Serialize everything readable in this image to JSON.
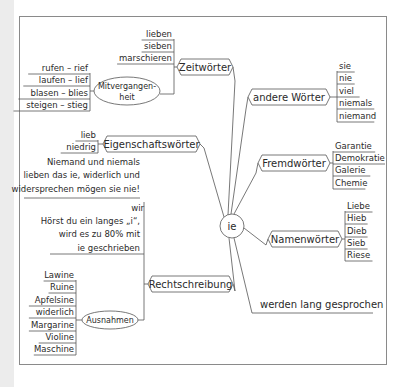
{
  "diagram": {
    "type": "mindmap",
    "center": {
      "label": "ie",
      "x": 232,
      "y": 226,
      "r": 12
    },
    "branches": [
      {
        "id": "zeitwoerter",
        "label": "Zeitwörter",
        "shape": "hex",
        "box": [
          177,
          59,
          56,
          16
        ],
        "leaves_side": "left",
        "leaves": [
          "lieben",
          "sieben",
          "marschieren"
        ],
        "leaves_x": [
          118,
          174
        ],
        "leaves_y": [
          37,
          49,
          61
        ],
        "sub": {
          "label_lines": [
            "Mitvergangen-",
            "heit"
          ],
          "shape": "ellipse",
          "cx": 127,
          "cy": 91,
          "rx": 33,
          "ry": 14,
          "leaves": [
            "rufen – rief",
            "laufen – lief",
            "blasen – blies",
            "steigen – stieg"
          ],
          "leaves_x": [
            30,
            90
          ],
          "leaves_y": [
            71,
            83,
            96,
            108
          ]
        }
      },
      {
        "id": "andere_woerter",
        "label": "andere Wörter",
        "shape": "hex",
        "box": [
          248,
          89,
          82,
          16
        ],
        "leaves_side": "right",
        "leaves": [
          "sie",
          "nie",
          "viel",
          "niemals",
          "niemand"
        ],
        "leaves_x": [
          337,
          380
        ],
        "leaves_y": [
          69,
          81,
          94,
          106,
          119
        ]
      },
      {
        "id": "eigenschaftswoerter",
        "label": "Eigenschaftswörter",
        "shape": "hex",
        "box": [
          103,
          136,
          97,
          16
        ],
        "leaves_side": "left",
        "leaves": [
          "lieb",
          "niedrig"
        ],
        "leaves_x": [
          62,
          98
        ],
        "leaves_y": [
          138,
          150
        ]
      },
      {
        "id": "fremdwoerter",
        "label": "Fremdwörter",
        "shape": "hex",
        "box": [
          258,
          155,
          72,
          16
        ],
        "leaves_side": "right",
        "leaves": [
          "Garantie",
          "Demokratie",
          "Galerie",
          "Chemie"
        ],
        "leaves_x": [
          333,
          378
        ],
        "leaves_y": [
          149,
          161,
          173,
          186
        ]
      },
      {
        "id": "namenwoerter",
        "label": "Namenwörter",
        "shape": "hex",
        "box": [
          268,
          231,
          74,
          16
        ],
        "leaves_side": "right",
        "leaves": [
          "Liebe",
          "Hieb",
          "Dieb",
          "Sieb",
          "Riese"
        ],
        "leaves_x": [
          345,
          369
        ],
        "leaves_y": [
          209,
          221,
          234,
          246,
          258
        ]
      },
      {
        "id": "rechtschreibung",
        "label": "Rechtschreibung",
        "shape": "hex",
        "box": [
          148,
          276,
          85,
          16
        ],
        "note": {
          "lines": [
            "Niemand und niemals",
            "lieben das ie, widerlich und",
            "widersprechen mögen sie nie!"
          ],
          "right_x": 140,
          "y": [
            165,
            178,
            192
          ],
          "underline_y": 198,
          "underline_x": [
            24,
            140
          ]
        },
        "rule": {
          "lines": [
            "wir",
            "Hörst du ein langes „i“,",
            "wird es zu 80% mit",
            "ie geschrieben"
          ],
          "right_x": 140,
          "y": [
            211,
            224,
            237,
            251
          ],
          "underline_y": 254,
          "underline_x": [
            50,
            144
          ]
        },
        "sub": {
          "label": "Ausnahmen",
          "shape": "ellipse",
          "cx": 110,
          "cy": 320,
          "rx": 28,
          "ry": 9,
          "leaves": [
            "Lawine",
            "Ruine",
            "Apfelsine",
            "widerlich",
            "Margarine",
            "Violine",
            "Maschine"
          ],
          "leaves_x": [
            30,
            76
          ],
          "leaves_y": [
            278,
            290,
            303,
            315,
            328,
            340,
            352
          ]
        }
      },
      {
        "id": "werden_lang_gesprochen",
        "label": "werden lang gesprochen",
        "shape": "underline",
        "text_x": 260,
        "text_y": 308,
        "underline": [
          252,
          313,
          373
        ]
      }
    ]
  }
}
